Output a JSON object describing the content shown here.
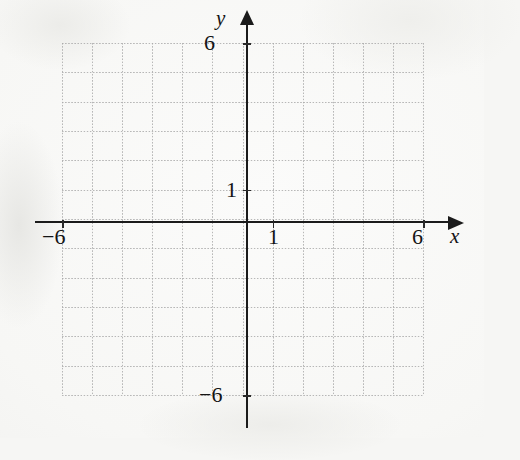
{
  "figure": {
    "kind": "cartesian-coordinate-grid",
    "background_color": "#f6f6f4",
    "axis_color": "#1b1b1b",
    "grid_color": "#a9a9a9"
  },
  "axes": {
    "x": {
      "label": "x",
      "tick_labels": [
        "−6",
        "1",
        "6"
      ],
      "tick_values": [
        -6,
        1,
        6
      ],
      "min": -6,
      "max": 6,
      "arrow": "right"
    },
    "y": {
      "label": "y",
      "tick_labels": [
        "6",
        "1",
        "−6"
      ],
      "tick_values": [
        6,
        1,
        -6
      ],
      "min": -6,
      "max": 6,
      "arrow": "up"
    }
  },
  "chart_data": {
    "type": "scatter",
    "title": "",
    "xlabel": "x",
    "ylabel": "y",
    "xlim": [
      -6,
      6
    ],
    "ylim": [
      -6,
      6
    ],
    "xticks": [
      -6,
      1,
      6
    ],
    "yticks": [
      -6,
      1,
      6
    ],
    "xtick_labels": [
      "−6",
      "1",
      "6"
    ],
    "ytick_labels": [
      "−6",
      "1",
      "6"
    ],
    "grid": true,
    "grid_style": "dotted",
    "grid_step": 1,
    "legend": null,
    "series": [],
    "annotations": []
  },
  "grid": {
    "x_lines": [
      -6,
      -5,
      -4,
      -3,
      -2,
      -1,
      0,
      1,
      2,
      3,
      4,
      5,
      6
    ],
    "y_lines": [
      -6,
      -5,
      -4,
      -3,
      -2,
      -1,
      0,
      1,
      2,
      3,
      4,
      5,
      6
    ]
  }
}
